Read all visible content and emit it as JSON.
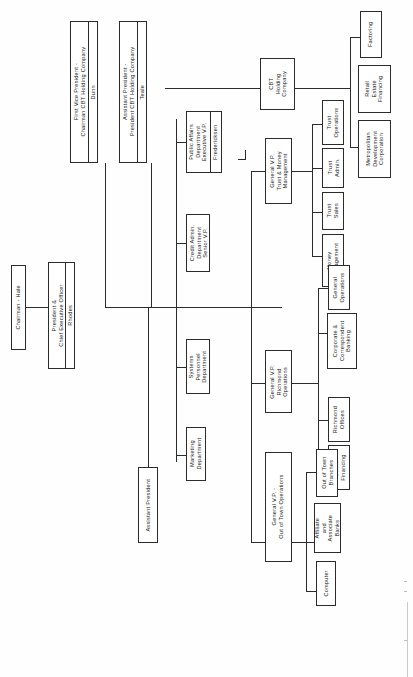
{
  "document": {
    "type": "organization-chart",
    "orientation": "rotated-90-ccw",
    "colors": {
      "line": "#2b2b2b",
      "box_border": "#2b2b2b",
      "box_fill": "#ffffff",
      "page": "#fefefe",
      "text": "#1a1a1a"
    }
  },
  "nodes": {
    "chairman": {
      "title": "Chairman - Hale"
    },
    "president_ceo": {
      "title": "President &\nChief Executive Officer",
      "person": "Rhodes"
    },
    "first_vice_president": {
      "title": "First Vice President -\nChairman CBT Holding Company",
      "person": "Dunn"
    },
    "assistant_president_cbt": {
      "title": "Assistant President -\nPresident CBT Holding Company",
      "person": "Teale"
    },
    "public_affairs": {
      "title": "Public Affairs\nDepartment\nExecutive V.P.",
      "person": "Fredericksen"
    },
    "credit_admin": {
      "title": "Credit Admin.\nDepartment\nSenior V.P."
    },
    "systems_personnel": {
      "title": "Systems\nPersonnel\nDepartment"
    },
    "marketing": {
      "title": "Marketing\nDepartment"
    },
    "assistant_president": {
      "title": "Assistant President"
    },
    "cbt_holding": {
      "title": "CBT\nHolding\nCompany"
    },
    "factoring": {
      "title": "Factoring"
    },
    "retail_estate_financing": {
      "title": "Retail\nEstate\nFinancing"
    },
    "metropolitan_development": {
      "title": "Metropolitan\nDevelopment\nCorporation"
    },
    "gvp_trust_money": {
      "title": "General V.P.\nTrust & Money\nManagement"
    },
    "trust_operations": {
      "title": "Trust\nOperations"
    },
    "trust_admin": {
      "title": "Trust\nAdmin."
    },
    "trust_sales": {
      "title": "Trust\nSales"
    },
    "money_management": {
      "title": "Money\nManagement"
    },
    "gvp_richmond": {
      "title": "General V.P.\nRichmond\nOperations"
    },
    "general_operations": {
      "title": "General\nOperations"
    },
    "corporate_correspondent": {
      "title": "Corporate &\nCorrespondent\nBanking"
    },
    "richmond_offices": {
      "title": "Richmond\nOffices"
    },
    "dealer_financing": {
      "title": "Dealer\nFinancing"
    },
    "gvp_out_of_town": {
      "title": "General V.P. -\nOut of Town Operations"
    },
    "out_of_town_branches": {
      "title": "Out of Town\nBranches"
    },
    "affiliate_associate_banks": {
      "title": "Affiliate\nand\nAssociate\nBanks"
    },
    "computer": {
      "title": "Computer"
    }
  }
}
